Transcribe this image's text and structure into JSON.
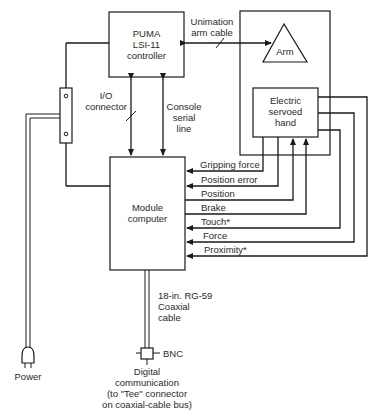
{
  "diagram": {
    "controller": {
      "line1": "PUMA",
      "line2": "LSI-11",
      "line3": "controller"
    },
    "arm_cable": {
      "line1": "Unimation",
      "line2": "arm cable"
    },
    "arm": {
      "label": "Arm"
    },
    "hand": {
      "line1": "Electric",
      "line2": "servoed",
      "line3": "hand"
    },
    "io_connector": {
      "line1": "I/O",
      "line2": "connector"
    },
    "console_line": {
      "line1": "Console",
      "line2": "serial",
      "line3": "line"
    },
    "module_computer": {
      "line1": "Module",
      "line2": "computer"
    },
    "signals": [
      {
        "label": "Gripping force",
        "direction": "to-module"
      },
      {
        "label": "Position error",
        "direction": "to-module"
      },
      {
        "label": "Position",
        "direction": "to-hand"
      },
      {
        "label": "Brake",
        "direction": "to-hand"
      },
      {
        "label": "Touch*",
        "direction": "to-module"
      },
      {
        "label": "Force",
        "direction": "to-module"
      },
      {
        "label": "Proximity*",
        "direction": "to-module"
      }
    ],
    "coax": {
      "line1": "18-in. RG-59",
      "line2": "Coaxial",
      "line3": "cable"
    },
    "bnc": {
      "label": "BNC"
    },
    "digital_comm": {
      "line1": "Digital",
      "line2": "communication",
      "line3": "(to \"Tee\" connector",
      "line4": "on coaxial-cable bus)"
    },
    "power": {
      "label": "Power"
    }
  }
}
